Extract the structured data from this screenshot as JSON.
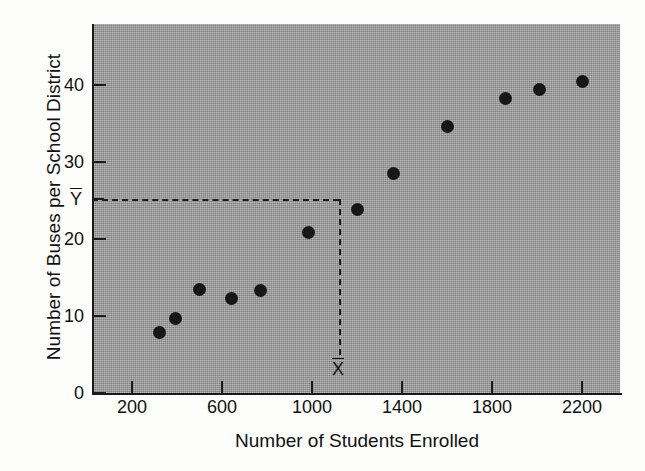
{
  "chart_data": {
    "type": "scatter",
    "title": "",
    "xlabel": "Number of Students Enrolled",
    "ylabel": "Number of Buses per School District",
    "xlim": [
      100,
      2400
    ],
    "ylim": [
      0,
      47
    ],
    "grid": false,
    "legend": "none",
    "x_ticks": [
      200,
      600,
      1000,
      1400,
      1800,
      2200
    ],
    "x_tick_labels": [
      "200",
      "600",
      "1000",
      "1400",
      "1800",
      "2200"
    ],
    "y_ticks": [
      0,
      10,
      20,
      30,
      40
    ],
    "y_tick_labels": [
      "0",
      "10",
      "20",
      "30",
      "40"
    ],
    "points": [
      {
        "x": 320,
        "y": 7.8
      },
      {
        "x": 395,
        "y": 9.7
      },
      {
        "x": 500,
        "y": 13.4
      },
      {
        "x": 640,
        "y": 12.3
      },
      {
        "x": 770,
        "y": 13.3
      },
      {
        "x": 985,
        "y": 20.8
      },
      {
        "x": 1200,
        "y": 23.8
      },
      {
        "x": 1360,
        "y": 28.5
      },
      {
        "x": 1600,
        "y": 34.6
      },
      {
        "x": 1860,
        "y": 38.2
      },
      {
        "x": 2010,
        "y": 39.4
      },
      {
        "x": 2200,
        "y": 40.5
      }
    ],
    "annotations": {
      "x_mean": {
        "label": "X",
        "value": 1120,
        "overbar": true
      },
      "y_mean": {
        "label": "Y",
        "value": 25.2,
        "overbar": true
      },
      "guide_style": "dashed"
    },
    "colors": {
      "panel_background": "#9d9d9d",
      "figure_background": "#fdfdfc",
      "marker": "#171717",
      "axis": "#1a1a1a",
      "guide": "#1b1b1b",
      "text": "#111111"
    }
  }
}
